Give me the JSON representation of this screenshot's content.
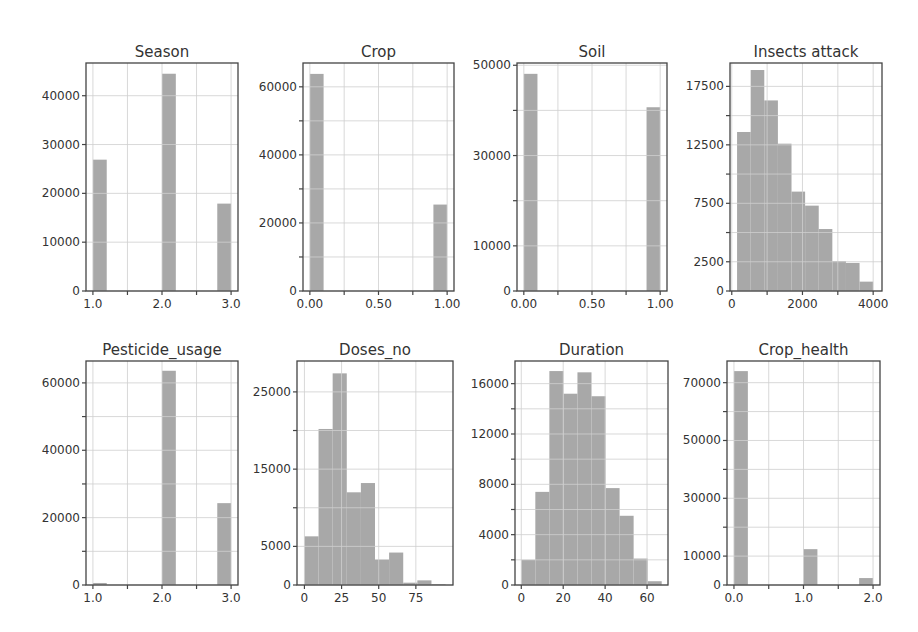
{
  "figure": {
    "title": "",
    "bar_color": "#a8a8a8",
    "grid_color": "#d0d0d0",
    "frame_color": "#444444",
    "text_color": "#333333"
  },
  "chart_data": [
    {
      "type": "bar",
      "title": "Season",
      "xlabel": "",
      "ylabel": "",
      "bins": [
        [
          1.0,
          1.2
        ],
        [
          1.8,
          2.0
        ],
        [
          2.0,
          2.2
        ],
        [
          2.8,
          3.0
        ]
      ],
      "x": [
        1.0,
        2.0,
        3.0
      ],
      "values": [
        26900,
        44500,
        17900
      ],
      "bar_edges": [
        [
          1.0,
          1.2
        ],
        [
          2.0,
          2.2
        ],
        [
          2.8,
          3.0
        ]
      ],
      "xlim": [
        0.9,
        3.1
      ],
      "ylim": [
        0,
        46700
      ],
      "xticks": [
        1.0,
        1.5,
        2.0,
        2.5,
        3.0
      ],
      "xtick_labels": [
        "1.0",
        "",
        "2.0",
        "",
        "3.0"
      ],
      "yticks": [
        0,
        10000,
        20000,
        30000,
        40000
      ],
      "ytick_labels": [
        "0",
        "10000",
        "20000",
        "30000",
        "40000"
      ],
      "grid": true
    },
    {
      "type": "bar",
      "title": "Crop",
      "xlabel": "",
      "ylabel": "",
      "x": [
        0.0,
        1.0
      ],
      "values": [
        63800,
        25400
      ],
      "bar_edges": [
        [
          0.0,
          0.1
        ],
        [
          0.9,
          1.0
        ]
      ],
      "xlim": [
        -0.05,
        1.05
      ],
      "ylim": [
        0,
        67000
      ],
      "xticks": [
        0.0,
        0.25,
        0.5,
        0.75,
        1.0
      ],
      "xtick_labels": [
        "0.00",
        "",
        "0.50",
        "",
        "1.00"
      ],
      "yticks": [
        0,
        10000,
        20000,
        30000,
        40000,
        50000,
        60000
      ],
      "ytick_labels": [
        "0",
        "",
        "20000",
        "",
        "40000",
        "",
        "60000"
      ],
      "grid": true
    },
    {
      "type": "bar",
      "title": "Soil",
      "xlabel": "",
      "ylabel": "",
      "x": [
        0.0,
        1.0
      ],
      "values": [
        48100,
        40700
      ],
      "bar_edges": [
        [
          0.0,
          0.1
        ],
        [
          0.9,
          1.0
        ]
      ],
      "xlim": [
        -0.05,
        1.05
      ],
      "ylim": [
        0,
        50500
      ],
      "xticks": [
        0.0,
        0.25,
        0.5,
        0.75,
        1.0
      ],
      "xtick_labels": [
        "0.00",
        "",
        "0.50",
        "",
        "1.00"
      ],
      "yticks": [
        0,
        10000,
        20000,
        30000,
        40000,
        50000
      ],
      "ytick_labels": [
        "0",
        "10000",
        "",
        "30000",
        "",
        "50000"
      ],
      "grid": true
    },
    {
      "type": "bar",
      "title": "Insects attack",
      "xlabel": "",
      "ylabel": "",
      "values": [
        13600,
        18900,
        16300,
        12600,
        8500,
        7300,
        5300,
        2550,
        2400,
        800
      ],
      "bar_edges": [
        [
          150,
          535
        ],
        [
          535,
          920
        ],
        [
          920,
          1305
        ],
        [
          1305,
          1690
        ],
        [
          1690,
          2075
        ],
        [
          2075,
          2460
        ],
        [
          2460,
          2845
        ],
        [
          2845,
          3230
        ],
        [
          3230,
          3615
        ],
        [
          3615,
          4000
        ]
      ],
      "xlim": [
        -50,
        4250
      ],
      "ylim": [
        0,
        19500
      ],
      "xticks": [
        0,
        1000,
        2000,
        3000,
        4000
      ],
      "xtick_labels": [
        "0",
        "",
        "2000",
        "",
        "4000"
      ],
      "yticks": [
        0,
        2500,
        5000,
        7500,
        10000,
        12500,
        15000,
        17500
      ],
      "ytick_labels": [
        "0",
        "2500",
        "",
        "7500",
        "",
        "12500",
        "",
        "17500"
      ],
      "grid": true
    },
    {
      "type": "bar",
      "title": "Pesticide_usage",
      "xlabel": "",
      "ylabel": "",
      "x": [
        1.0,
        2.0,
        3.0
      ],
      "values": [
        600,
        63600,
        24300
      ],
      "bar_edges": [
        [
          1.0,
          1.2
        ],
        [
          2.0,
          2.2
        ],
        [
          2.8,
          3.0
        ]
      ],
      "xlim": [
        0.9,
        3.1
      ],
      "ylim": [
        0,
        66500
      ],
      "xticks": [
        1.0,
        1.5,
        2.0,
        2.5,
        3.0
      ],
      "xtick_labels": [
        "1.0",
        "",
        "2.0",
        "",
        "3.0"
      ],
      "yticks": [
        0,
        10000,
        20000,
        30000,
        40000,
        50000,
        60000
      ],
      "ytick_labels": [
        "0",
        "",
        "20000",
        "",
        "40000",
        "",
        "60000"
      ],
      "grid": true
    },
    {
      "type": "bar",
      "title": "Doses_no",
      "xlabel": "",
      "ylabel": "",
      "values": [
        6300,
        20200,
        27400,
        12000,
        13200,
        3300,
        4200,
        300,
        600,
        100
      ],
      "bar_edges": [
        [
          0,
          9.5
        ],
        [
          9.5,
          19
        ],
        [
          19,
          28.5
        ],
        [
          28.5,
          38
        ],
        [
          38,
          47.5
        ],
        [
          47.5,
          57
        ],
        [
          57,
          66.5
        ],
        [
          66.5,
          76
        ],
        [
          76,
          85.5
        ],
        [
          85.5,
          95
        ]
      ],
      "xlim": [
        -5,
        100
      ],
      "ylim": [
        0,
        29000
      ],
      "xticks": [
        0,
        25,
        50,
        75
      ],
      "xtick_labels": [
        "0",
        "25",
        "50",
        "75"
      ],
      "yticks": [
        0,
        5000,
        10000,
        15000,
        20000,
        25000
      ],
      "ytick_labels": [
        "0",
        "5000",
        "",
        "15000",
        "",
        "25000"
      ],
      "grid": true
    },
    {
      "type": "bar",
      "title": "Duration",
      "xlabel": "",
      "ylabel": "",
      "values": [
        2000,
        7400,
        17000,
        15200,
        16900,
        15000,
        7700,
        5500,
        2100,
        300
      ],
      "bar_edges": [
        [
          0,
          6.7
        ],
        [
          6.7,
          13.4
        ],
        [
          13.4,
          20.1
        ],
        [
          20.1,
          26.8
        ],
        [
          26.8,
          33.5
        ],
        [
          33.5,
          40.2
        ],
        [
          40.2,
          46.9
        ],
        [
          46.9,
          53.6
        ],
        [
          53.6,
          60.3
        ],
        [
          60.3,
          67
        ]
      ],
      "xlim": [
        -3,
        70
      ],
      "ylim": [
        0,
        17800
      ],
      "xticks": [
        0,
        20,
        40,
        60
      ],
      "xtick_labels": [
        "0",
        "20",
        "40",
        "60"
      ],
      "yticks": [
        0,
        2000,
        4000,
        6000,
        8000,
        10000,
        12000,
        14000,
        16000
      ],
      "ytick_labels": [
        "0",
        "",
        "4000",
        "",
        "8000",
        "",
        "12000",
        "",
        "16000"
      ],
      "grid": true
    },
    {
      "type": "bar",
      "title": "Crop_health",
      "xlabel": "",
      "ylabel": "",
      "x": [
        0.0,
        1.0,
        2.0
      ],
      "values": [
        74000,
        12400,
        2400
      ],
      "bar_edges": [
        [
          0.0,
          0.2
        ],
        [
          1.0,
          1.2
        ],
        [
          1.8,
          2.0
        ]
      ],
      "xlim": [
        -0.1,
        2.1
      ],
      "ylim": [
        0,
        77500
      ],
      "xticks": [
        0.0,
        0.5,
        1.0,
        1.5,
        2.0
      ],
      "xtick_labels": [
        "0.0",
        "",
        "1.0",
        "",
        "2.0"
      ],
      "yticks": [
        0,
        10000,
        20000,
        30000,
        40000,
        50000,
        60000,
        70000
      ],
      "ytick_labels": [
        "0",
        "10000",
        "",
        "30000",
        "",
        "50000",
        "",
        "70000"
      ],
      "grid": true
    }
  ],
  "layout": {
    "panels": [
      {
        "left": 86,
        "top": 63,
        "right": 238,
        "bottom": 291
      },
      {
        "left": 303,
        "top": 63,
        "right": 454,
        "bottom": 291
      },
      {
        "left": 517,
        "top": 63,
        "right": 667,
        "bottom": 291
      },
      {
        "left": 730,
        "top": 63,
        "right": 882,
        "bottom": 291
      },
      {
        "left": 86,
        "top": 361,
        "right": 238,
        "bottom": 585
      },
      {
        "left": 297,
        "top": 361,
        "right": 453,
        "bottom": 585
      },
      {
        "left": 515,
        "top": 361,
        "right": 668,
        "bottom": 585
      },
      {
        "left": 727,
        "top": 361,
        "right": 880,
        "bottom": 585
      }
    ]
  }
}
